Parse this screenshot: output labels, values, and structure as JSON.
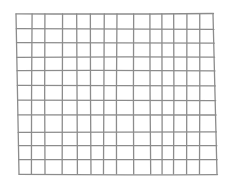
{
  "figure": {
    "kind": "hand-drawn grid sketch",
    "background": "#ffffff",
    "stroke_color": "#8c8c8c",
    "stroke_width": 1.3,
    "columns": 14,
    "rows": 11,
    "outline": {
      "top_left": [
        16,
        14
      ],
      "top_right": [
        213,
        15
      ],
      "bottom_left": [
        19,
        174
      ],
      "bottom_right": [
        217,
        173
      ]
    },
    "vertical_lines_x_at_middle": [
      18,
      32,
      45,
      62,
      77,
      91,
      104,
      117,
      133,
      150,
      162,
      174,
      187,
      200,
      214
    ],
    "horizontal_lines_y_at_middle": [
      14,
      29,
      43,
      57,
      71,
      86,
      100,
      115,
      132,
      146,
      160,
      174
    ]
  }
}
